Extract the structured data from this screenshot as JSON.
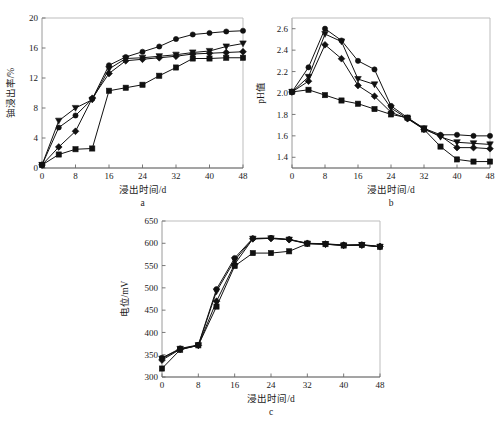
{
  "figure": {
    "xlabel": "浸出时间/d",
    "panel_letters": {
      "a": "a",
      "b": "b",
      "c": "c"
    }
  },
  "chart_data": [
    {
      "panel": "a",
      "type": "line",
      "title": "",
      "xlabel": "浸出时间/d",
      "ylabel": "铀浸出率/%",
      "xlim": [
        0,
        48
      ],
      "ylim": [
        0,
        20
      ],
      "xticks": [
        0,
        8,
        16,
        24,
        32,
        40,
        48
      ],
      "yticks": [
        0,
        4,
        8,
        12,
        16,
        20
      ],
      "grid": false,
      "legend": "none",
      "series": [
        {
          "name": "series-1",
          "marker": "circle",
          "x": [
            0,
            4,
            8,
            12,
            16,
            20,
            24,
            28,
            32,
            36,
            40,
            44,
            48
          ],
          "values": [
            0.4,
            5.4,
            7.0,
            9.2,
            13.7,
            14.8,
            15.5,
            16.2,
            17.2,
            17.8,
            18.0,
            18.2,
            18.3
          ]
        },
        {
          "name": "series-2",
          "marker": "triangle",
          "x": [
            0,
            4,
            8,
            12,
            16,
            20,
            24,
            28,
            32,
            36,
            40,
            44,
            48
          ],
          "values": [
            0.4,
            6.3,
            8.0,
            9.1,
            13.2,
            14.6,
            14.7,
            14.9,
            15.1,
            15.4,
            15.6,
            16.2,
            16.6
          ]
        },
        {
          "name": "series-3",
          "marker": "diamond",
          "x": [
            0,
            4,
            8,
            12,
            16,
            20,
            24,
            28,
            32,
            36,
            40,
            44,
            48
          ],
          "values": [
            0.4,
            2.8,
            4.9,
            9.3,
            12.6,
            14.3,
            14.5,
            14.7,
            14.9,
            15.2,
            15.3,
            15.4,
            15.5
          ]
        },
        {
          "name": "series-4",
          "marker": "square",
          "x": [
            0,
            4,
            8,
            12,
            16,
            20,
            24,
            28,
            32,
            36,
            40,
            44,
            48
          ],
          "values": [
            0.4,
            1.8,
            2.5,
            2.6,
            10.3,
            10.7,
            11.1,
            12.3,
            13.4,
            14.6,
            14.6,
            14.7,
            14.7
          ]
        }
      ]
    },
    {
      "panel": "b",
      "type": "line",
      "title": "",
      "xlabel": "浸出时间/d",
      "ylabel": "pH值",
      "xlim": [
        0,
        48
      ],
      "ylim": [
        1.3,
        2.7
      ],
      "xticks": [
        0,
        8,
        16,
        24,
        32,
        40,
        48
      ],
      "yticks": [
        1.4,
        1.6,
        1.8,
        2.0,
        2.2,
        2.4,
        2.6
      ],
      "grid": false,
      "legend": "none",
      "series": [
        {
          "name": "series-1",
          "marker": "circle",
          "x": [
            0,
            4,
            8,
            12,
            16,
            20,
            24,
            28,
            32,
            36,
            40,
            44,
            48
          ],
          "values": [
            2.01,
            2.24,
            2.6,
            2.49,
            2.3,
            2.22,
            1.88,
            1.77,
            1.67,
            1.61,
            1.61,
            1.6,
            1.6
          ]
        },
        {
          "name": "series-2",
          "marker": "triangle",
          "x": [
            0,
            4,
            8,
            12,
            16,
            20,
            24,
            28,
            32,
            36,
            40,
            44,
            48
          ],
          "values": [
            2.01,
            2.15,
            2.55,
            2.48,
            2.13,
            2.08,
            1.86,
            1.76,
            1.67,
            1.59,
            1.54,
            1.53,
            1.52
          ]
        },
        {
          "name": "series-3",
          "marker": "diamond",
          "x": [
            0,
            4,
            8,
            12,
            16,
            20,
            24,
            28,
            32,
            36,
            40,
            44,
            48
          ],
          "values": [
            2.01,
            2.11,
            2.45,
            2.32,
            2.07,
            1.97,
            1.82,
            1.76,
            1.66,
            1.6,
            1.49,
            1.49,
            1.48
          ]
        },
        {
          "name": "series-4",
          "marker": "square",
          "x": [
            0,
            4,
            8,
            12,
            16,
            20,
            24,
            28,
            32,
            36,
            40,
            44,
            48
          ],
          "values": [
            2.01,
            2.03,
            1.98,
            1.93,
            1.9,
            1.85,
            1.8,
            1.77,
            1.66,
            1.5,
            1.38,
            1.36,
            1.36
          ]
        }
      ]
    },
    {
      "panel": "c",
      "type": "line",
      "title": "",
      "xlabel": "浸出时间/d",
      "ylabel": "电位/mV",
      "xlim": [
        0,
        48
      ],
      "ylim": [
        300,
        650
      ],
      "xticks": [
        0,
        8,
        16,
        24,
        32,
        40,
        48
      ],
      "yticks": [
        300,
        350,
        400,
        450,
        500,
        550,
        600,
        650
      ],
      "grid": false,
      "legend": "none",
      "series": [
        {
          "name": "series-1",
          "marker": "circle",
          "x": [
            0,
            4,
            8,
            12,
            16,
            20,
            24,
            28,
            32,
            36,
            40,
            44,
            48
          ],
          "values": [
            343,
            364,
            372,
            497,
            567,
            611,
            612,
            609,
            600,
            599,
            596,
            597,
            593
          ]
        },
        {
          "name": "series-2",
          "marker": "triangle",
          "x": [
            0,
            4,
            8,
            12,
            16,
            20,
            24,
            28,
            32,
            36,
            40,
            44,
            48
          ],
          "values": [
            341,
            363,
            371,
            492,
            562,
            610,
            611,
            608,
            599,
            598,
            595,
            596,
            592
          ]
        },
        {
          "name": "series-3",
          "marker": "diamond",
          "x": [
            0,
            4,
            8,
            12,
            16,
            20,
            24,
            28,
            32,
            36,
            40,
            44,
            48
          ],
          "values": [
            338,
            362,
            371,
            470,
            553,
            610,
            611,
            608,
            600,
            598,
            596,
            596,
            593
          ]
        },
        {
          "name": "series-4",
          "marker": "square",
          "x": [
            0,
            4,
            8,
            12,
            16,
            20,
            24,
            28,
            32,
            36,
            40,
            44,
            48
          ],
          "values": [
            319,
            361,
            371,
            458,
            549,
            578,
            578,
            582,
            599,
            598,
            595,
            596,
            592
          ]
        }
      ]
    }
  ]
}
